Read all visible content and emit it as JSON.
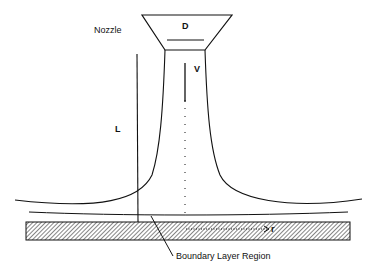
{
  "diagram": {
    "type": "impinging jet schematic",
    "labels": {
      "nozzle": "Nozzle",
      "diameter": "D",
      "velocity": "V",
      "length": "L",
      "radius": "r",
      "boundary_layer": "Boundary Layer Region"
    },
    "colors": {
      "line": "#111111",
      "background": "#ffffff"
    }
  }
}
